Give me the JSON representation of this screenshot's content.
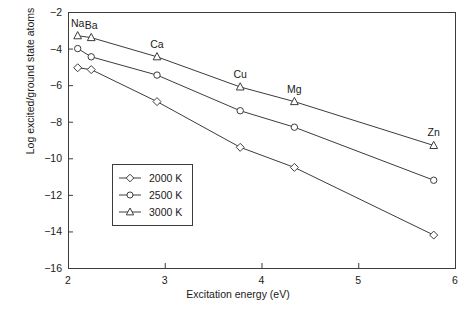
{
  "chart_data": {
    "type": "line",
    "title": "",
    "xlabel": "Excitation energy (eV)",
    "ylabel": "Log excited/ground state atoms",
    "xlim": [
      2,
      6
    ],
    "ylim": [
      -16,
      -2
    ],
    "xticks": [
      "2",
      "3",
      "4",
      "5",
      "6"
    ],
    "xtick_values": [
      2,
      3,
      4,
      5,
      6
    ],
    "yticks": [
      "−2",
      "−4",
      "−6",
      "−8",
      "−10",
      "−12",
      "−14",
      "−16"
    ],
    "ytick_values": [
      -2,
      -4,
      -6,
      -8,
      -10,
      -12,
      -14,
      -16
    ],
    "grid": false,
    "legend_position": "center-left",
    "point_labels": [
      {
        "text": "Na",
        "x": 2.1,
        "y": -3.3
      },
      {
        "text": "Ba",
        "x": 2.24,
        "y": -3.4
      },
      {
        "text": "Ca",
        "x": 2.92,
        "y": -4.45
      },
      {
        "text": "Cu",
        "x": 3.78,
        "y": -6.1
      },
      {
        "text": "Mg",
        "x": 4.34,
        "y": -6.9
      },
      {
        "text": "Zn",
        "x": 5.78,
        "y": -9.3
      }
    ],
    "x": [
      2.1,
      2.24,
      2.92,
      3.78,
      4.34,
      5.78
    ],
    "series": [
      {
        "name": "2000 K",
        "marker": "diamond",
        "values": [
          -5.05,
          -5.15,
          -6.9,
          -9.4,
          -10.5,
          -14.2
        ]
      },
      {
        "name": "2500 K",
        "marker": "circle",
        "values": [
          -4.0,
          -4.45,
          -5.45,
          -7.4,
          -8.3,
          -11.2
        ]
      },
      {
        "name": "3000 K",
        "marker": "triangle",
        "values": [
          -3.3,
          -3.4,
          -4.45,
          -6.1,
          -6.9,
          -9.3
        ]
      }
    ],
    "colors": {
      "line": "#3c3c3c",
      "axis": "#3c3c3c",
      "text": "#1a1a1a",
      "background": "#ffffff"
    }
  },
  "legend": {
    "entries": [
      {
        "label": "2000 K",
        "marker": "diamond"
      },
      {
        "label": "2500 K",
        "marker": "circle"
      },
      {
        "label": "3000 K",
        "marker": "triangle"
      }
    ]
  }
}
